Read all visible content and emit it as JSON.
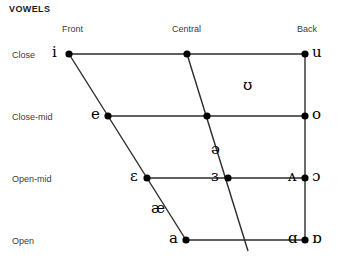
{
  "title": "VOWELS",
  "chart_data": {
    "type": "scatter",
    "title": "VOWELS",
    "subtitle": "",
    "xlabel": "",
    "ylabel": "",
    "grid": false,
    "legend_position": "none",
    "x_axis": {
      "name": "backness",
      "tick_labels": [
        "Front",
        "Central",
        "Back"
      ],
      "tick_positions_px": [
        69,
        187,
        305
      ]
    },
    "y_axis": {
      "name": "height",
      "tick_labels": [
        "Close",
        "Close-mid",
        "Open-mid",
        "Open"
      ],
      "tick_positions_px": [
        54,
        116,
        178,
        240
      ]
    },
    "columns": [
      "Front",
      "Central",
      "Back"
    ],
    "rows": [
      "Close",
      "Close-mid",
      "Open-mid",
      "Open"
    ],
    "points": [
      {
        "symbol": "i",
        "row": "Close",
        "column": "Front",
        "x": 69,
        "y": 54,
        "dot": true,
        "label_side": "left"
      },
      {
        "symbol": "u",
        "row": "Close",
        "column": "Back",
        "x": 305,
        "y": 54,
        "dot": true,
        "label_side": "right"
      },
      {
        "symbol": "",
        "row": "Close",
        "column": "Central",
        "x": 187,
        "y": 54,
        "dot": true,
        "label_side": "none"
      },
      {
        "symbol": "e",
        "row": "Close-mid",
        "column": "Front",
        "x": 108,
        "y": 116,
        "dot": true,
        "label_side": "left"
      },
      {
        "symbol": "o",
        "row": "Close-mid",
        "column": "Back",
        "x": 305,
        "y": 116,
        "dot": true,
        "label_side": "right"
      },
      {
        "symbol": "",
        "row": "Close-mid",
        "column": "Central",
        "x": 207,
        "y": 116,
        "dot": true,
        "label_side": "none"
      },
      {
        "symbol": "ʊ",
        "row": "between Close and Close-mid",
        "column": "near-back",
        "x": 248,
        "y": 86,
        "dot": false,
        "label_side": "none"
      },
      {
        "symbol": "ə",
        "row": "between Close-mid and Open-mid",
        "column": "Central",
        "x": 216,
        "y": 150,
        "dot": false,
        "label_side": "none"
      },
      {
        "symbol": "ɛ",
        "row": "Open-mid",
        "column": "Front",
        "x": 147,
        "y": 178,
        "dot": true,
        "label_side": "left"
      },
      {
        "symbol": "ɜ",
        "row": "Open-mid",
        "column": "Central",
        "x": 228,
        "y": 178,
        "dot": true,
        "label_side": "left"
      },
      {
        "symbol": "ʌ",
        "row": "Open-mid",
        "column": "Back",
        "x": 305,
        "y": 178,
        "dot": true,
        "label_side": "left"
      },
      {
        "symbol": "ɔ",
        "row": "Open-mid",
        "column": "Back",
        "x": 305,
        "y": 178,
        "dot": true,
        "label_side": "right"
      },
      {
        "symbol": "æ",
        "row": "between Open-mid and Open",
        "column": "Front",
        "x": 156,
        "y": 209,
        "dot": false,
        "label_side": "none"
      },
      {
        "symbol": "a",
        "row": "Open",
        "column": "Front",
        "x": 186,
        "y": 240,
        "dot": true,
        "label_side": "left"
      },
      {
        "symbol": "ɑ",
        "row": "Open",
        "column": "Back",
        "x": 305,
        "y": 240,
        "dot": true,
        "label_side": "left"
      },
      {
        "symbol": "ɒ",
        "row": "Open",
        "column": "Back",
        "x": 305,
        "y": 240,
        "dot": true,
        "label_side": "right"
      }
    ],
    "edges": [
      {
        "name": "close-row-line",
        "from": [
          69,
          54
        ],
        "to": [
          305,
          54
        ]
      },
      {
        "name": "close-mid-row-line",
        "from": [
          108,
          116
        ],
        "to": [
          305,
          116
        ]
      },
      {
        "name": "open-mid-row-line",
        "from": [
          147,
          178
        ],
        "to": [
          305,
          178
        ]
      },
      {
        "name": "open-row-line",
        "from": [
          186,
          240
        ],
        "to": [
          305,
          240
        ]
      },
      {
        "name": "front-diagonal",
        "from": [
          69,
          54
        ],
        "to": [
          186,
          240
        ]
      },
      {
        "name": "central-diagonal",
        "from": [
          187,
          54
        ],
        "to": [
          248,
          251
        ]
      },
      {
        "name": "back-vertical",
        "from": [
          305,
          54
        ],
        "to": [
          305,
          240
        ]
      }
    ],
    "colors": {
      "background": "#ffffff",
      "line": "#2b2b2b",
      "dot": "#000000",
      "symbol": "#000000",
      "label": "#3a3a3a",
      "title": "#1a1a1a"
    }
  },
  "column_headers": [
    {
      "label": "Front",
      "x": 62,
      "y": 24
    },
    {
      "label": "Central",
      "x": 172,
      "y": 24
    },
    {
      "label": "Back",
      "x": 297,
      "y": 24
    }
  ],
  "row_labels": [
    {
      "label": "Close",
      "x": 12,
      "y": 50
    },
    {
      "label": "Close-mid",
      "x": 12,
      "y": 112
    },
    {
      "label": "Open-mid",
      "x": 12,
      "y": 174
    },
    {
      "label": "Open",
      "x": 12,
      "y": 236
    }
  ]
}
